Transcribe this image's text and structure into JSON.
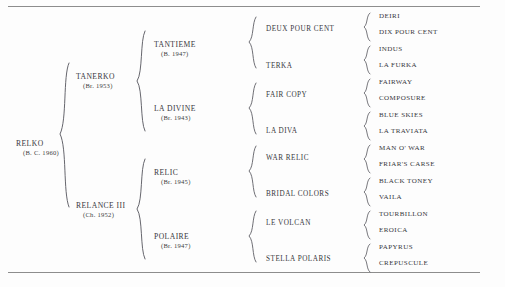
{
  "document": {
    "type": "pedigree-chart",
    "subject": "RELKO"
  },
  "pedigree": {
    "generation_1": [
      {
        "name": "RELKO",
        "year": "(B. C. 1960)"
      }
    ],
    "generation_2": [
      {
        "name": "TANERKO",
        "year": "(Br. 1953)"
      },
      {
        "name": "RELANCE III",
        "year": "(Ch. 1952)"
      }
    ],
    "generation_3": [
      {
        "name": "TANTIEME",
        "year": "(B. 1947)"
      },
      {
        "name": "LA DIVINE",
        "year": "(Br. 1943)"
      },
      {
        "name": "RELIC",
        "year": "(Br. 1945)"
      },
      {
        "name": "POLAIRE",
        "year": "(Br. 1947)"
      }
    ],
    "generation_4": [
      {
        "name": "DEUX POUR CENT"
      },
      {
        "name": "TERKA"
      },
      {
        "name": "FAIR COPY"
      },
      {
        "name": "LA DIVA"
      },
      {
        "name": "WAR RELIC"
      },
      {
        "name": "BRIDAL COLORS"
      },
      {
        "name": "LE VOLCAN"
      },
      {
        "name": "STELLA POLARIS"
      }
    ],
    "generation_5": [
      {
        "name": "DEIRI"
      },
      {
        "name": "DIX POUR CENT"
      },
      {
        "name": "INDUS"
      },
      {
        "name": "LA FURKA"
      },
      {
        "name": "FAIRWAY"
      },
      {
        "name": "COMPOSURE"
      },
      {
        "name": "BLUE SKIES"
      },
      {
        "name": "LA TRAVIATA"
      },
      {
        "name": "MAN O' WAR"
      },
      {
        "name": "FRIAR'S CARSE"
      },
      {
        "name": "BLACK TONEY"
      },
      {
        "name": "VAILA"
      },
      {
        "name": "TOURBILLON"
      },
      {
        "name": "EROICA"
      },
      {
        "name": "PAPYRUS"
      },
      {
        "name": "CREPUSCULE"
      }
    ]
  },
  "colors": {
    "ink": "#37373c",
    "rule": "#8d8d8d",
    "brace": "#55555c",
    "background": "#fdfdfd"
  }
}
